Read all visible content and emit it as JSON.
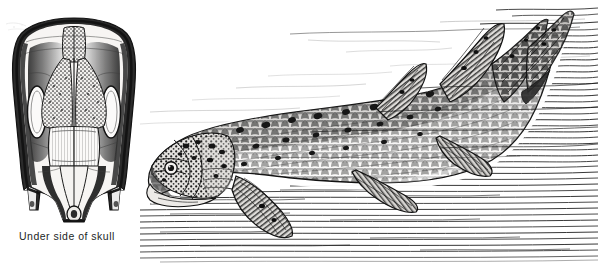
{
  "plate": {
    "kind": "scientific-illustration-plate",
    "subject": "coelacanth",
    "background_color": "#ffffff",
    "ink_color": "#1a1a1a",
    "figure_count": 3
  },
  "figures": [
    {
      "id": "skull",
      "caption": "Under side of skull",
      "icon_name": "skull-underside-illustration",
      "position": "left",
      "orientation": "ventral view, anterior up"
    },
    {
      "id": "tooth",
      "caption": "A lower tooth",
      "icon_name": "lower-tooth-illustration",
      "position": "top-center",
      "orientation": "fan-shaped crown, ribbed"
    },
    {
      "id": "fish",
      "caption": "",
      "icon_name": "coelacanth-fish-illustration",
      "position": "right",
      "orientation": "left-facing, swimming in hatched water"
    }
  ],
  "captions": {
    "skull": "Under side of skull",
    "tooth": "A lower tooth"
  },
  "colors": {
    "ink": "#1a1a1a",
    "paper": "#ffffff",
    "caption_text": "#221f1f",
    "mid_tone": "#6b6b6b",
    "light_tone": "#b9b9b9"
  }
}
